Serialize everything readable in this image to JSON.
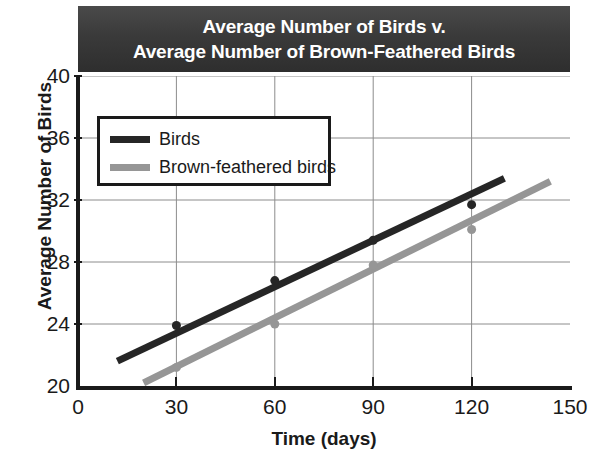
{
  "title": {
    "line1": "Average Number of Birds v.",
    "line2": "Average Number of Brown-Feathered Birds",
    "background_color": "#3a3a3a",
    "text_color": "#ffffff"
  },
  "legend": {
    "position": "top-left-inside",
    "items": [
      {
        "label": "Birds",
        "color": "#262626"
      },
      {
        "label": "Brown-feathered birds",
        "color": "#969696"
      }
    ]
  },
  "axes": {
    "x_label": "Time (days)",
    "y_label": "Average Number of Birds",
    "x_ticks": [
      "0",
      "30",
      "60",
      "90",
      "120",
      "150"
    ],
    "y_ticks": [
      "20",
      "24",
      "28",
      "32",
      "36",
      "40"
    ]
  },
  "chart_data": {
    "type": "scatter",
    "title": "Average Number of Birds v. Average Number of Brown-Feathered Birds",
    "xlabel": "Time (days)",
    "ylabel": "Average Number of Birds",
    "xlim": [
      0,
      150
    ],
    "ylim": [
      20,
      40
    ],
    "xticks": [
      0,
      30,
      60,
      90,
      120,
      150
    ],
    "yticks": [
      20,
      24,
      28,
      32,
      36,
      40
    ],
    "grid": true,
    "legend_position": "upper left",
    "series": [
      {
        "name": "Birds",
        "color": "#262626",
        "marker": "dot",
        "x": [
          30,
          60,
          90,
          120
        ],
        "values": [
          23.9,
          26.8,
          29.4,
          31.7
        ],
        "trendline": {
          "x": [
            12,
            130
          ],
          "y": [
            21.6,
            33.4
          ]
        }
      },
      {
        "name": "Brown-feathered birds",
        "color": "#969696",
        "marker": "dot",
        "x": [
          30,
          60,
          90,
          120
        ],
        "values": [
          21.2,
          24.0,
          27.8,
          30.1
        ],
        "trendline": {
          "x": [
            20,
            144
          ],
          "y": [
            20.2,
            33.2
          ]
        }
      }
    ]
  }
}
